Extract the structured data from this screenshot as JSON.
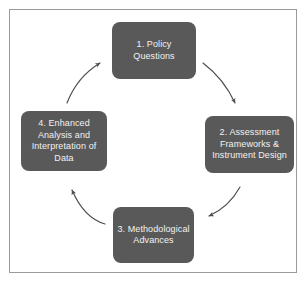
{
  "diagram": {
    "type": "cyclical-process-diagram",
    "title": "",
    "border_color": "#9a9a9a",
    "node_fill_color": "#595959",
    "node_text_color": "#f2f2f2",
    "arrow_color": "#4d4d4d",
    "background_color": "#ffffff",
    "nodes": [
      {
        "id": "node-1",
        "number": "1.",
        "label": "1. Policy Questions"
      },
      {
        "id": "node-2",
        "number": "2.",
        "label": "2. Assessment\nFrameworks &\nInstrument Design"
      },
      {
        "id": "node-3",
        "number": "3.",
        "label": "3. Methodological\nAdvances"
      },
      {
        "id": "node-4",
        "number": "4.",
        "label": "4. Enhanced\nAnalysis and\nInterpretation of\nData"
      }
    ],
    "arrows": [
      {
        "id": "arrow-1-to-2",
        "from": "node-1",
        "to": "node-2",
        "direction": "down-right"
      },
      {
        "id": "arrow-2-to-3",
        "from": "node-2",
        "to": "node-3",
        "direction": "down-left"
      },
      {
        "id": "arrow-3-to-4",
        "from": "node-3",
        "to": "node-4",
        "direction": "up-left"
      },
      {
        "id": "arrow-4-to-1",
        "from": "node-4",
        "to": "node-1",
        "direction": "up-right"
      }
    ]
  }
}
